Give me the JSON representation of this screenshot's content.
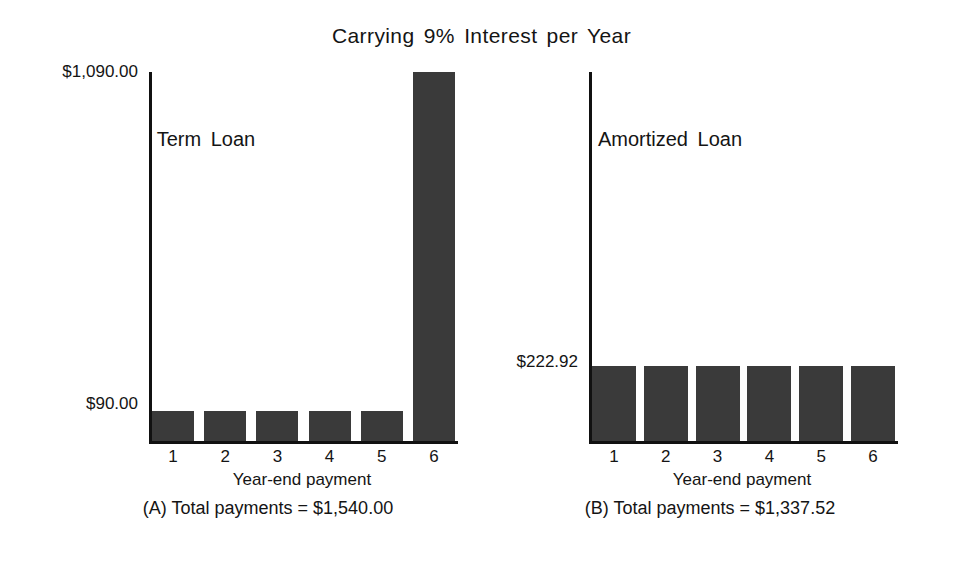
{
  "figure": {
    "title": "Carrying 9% Interest per Year"
  },
  "panels": [
    {
      "id": "term-loan",
      "title": "Term Loan",
      "caption": "(A) Total payments = $1,540.00",
      "xlabel": "Year-end payment",
      "yticks": [
        "$1,090.00",
        "$90.00"
      ]
    },
    {
      "id": "amortized-loan",
      "title": "Amortized Loan",
      "caption": "(B) Total payments = $1,337.52",
      "xlabel": "Year-end payment",
      "yticks": [
        "$222.92"
      ]
    }
  ],
  "xtick_labels": [
    "1",
    "2",
    "3",
    "4",
    "5",
    "6"
  ],
  "colors": {
    "bar": "#3a3a3a",
    "axis": "#111111",
    "text": "#141414",
    "background": "#ffffff"
  },
  "chart_data": [
    {
      "type": "bar",
      "title": "Term Loan",
      "subtitle": "Carrying 9% Interest per Year",
      "categories": [
        "1",
        "2",
        "3",
        "4",
        "5",
        "6"
      ],
      "values": [
        90.0,
        90.0,
        90.0,
        90.0,
        90.0,
        1090.0
      ],
      "value_labels": [
        "$90.00",
        "$90.00",
        "$90.00",
        "$90.00",
        "$90.00",
        "$1,090.00"
      ],
      "xlabel": "Year-end payment",
      "ylabel": "",
      "ylim": [
        0,
        1090
      ],
      "ytick_values": [
        90,
        1090
      ],
      "ytick_labels": [
        "$90.00",
        "$1,090.00"
      ],
      "grid": false,
      "legend": false,
      "annotation": "(A) Total payments = $1,540.00",
      "total": 1540.0
    },
    {
      "type": "bar",
      "title": "Amortized Loan",
      "subtitle": "Carrying 9% Interest per Year",
      "categories": [
        "1",
        "2",
        "3",
        "4",
        "5",
        "6"
      ],
      "values": [
        222.92,
        222.92,
        222.92,
        222.92,
        222.92,
        222.92
      ],
      "value_labels": [
        "$222.92",
        "$222.92",
        "$222.92",
        "$222.92",
        "$222.92",
        "$222.92"
      ],
      "xlabel": "Year-end payment",
      "ylabel": "",
      "ylim": [
        0,
        1090
      ],
      "ytick_values": [
        222.92
      ],
      "ytick_labels": [
        "$222.92"
      ],
      "grid": false,
      "legend": false,
      "annotation": "(B) Total payments = $1,337.52",
      "total": 1337.52
    }
  ]
}
